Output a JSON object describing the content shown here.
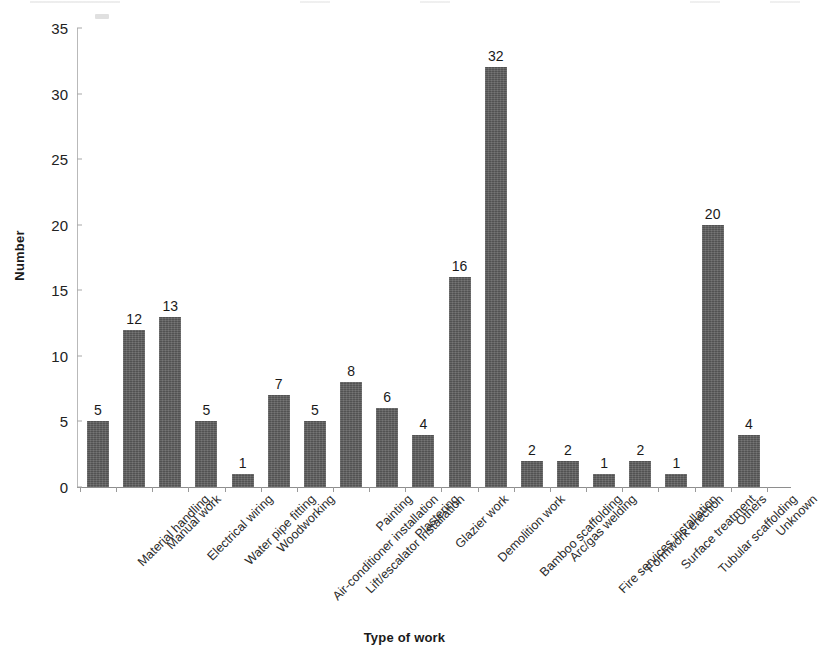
{
  "chart_data": {
    "type": "bar",
    "title": "",
    "xlabel": "Type of work",
    "ylabel": "Number",
    "ylim": [
      0,
      35
    ],
    "ytick_step": 5,
    "yticks": [
      0,
      5,
      10,
      15,
      20,
      25,
      30,
      35
    ],
    "grid": false,
    "legend": "none",
    "bar_color": "#5b5b5b",
    "show_value_labels": true,
    "categories": [
      "Material handling",
      "Manual work",
      "Electrical wiring",
      "Water pipe fitting",
      "Woodworking",
      "Air-conditioner installation",
      "Lift/escalator installation",
      "Painting",
      "Plastering",
      "Glazier work",
      "Demolition work",
      "Bamboo scaffolding",
      "Arc/gas welding",
      "Fire services installation",
      "Formwork erection",
      "Surface treatment",
      "Tubular scaffolding",
      "Others",
      "Unknown"
    ],
    "values": [
      5,
      12,
      13,
      5,
      1,
      7,
      5,
      8,
      6,
      4,
      16,
      32,
      2,
      2,
      1,
      2,
      1,
      20,
      4
    ]
  }
}
